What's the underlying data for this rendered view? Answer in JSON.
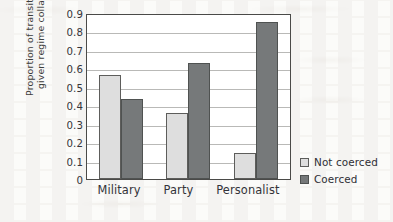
{
  "chart_data": {
    "type": "bar",
    "title": "",
    "xlabel": "",
    "ylabel": "Proportion of transitions, given regime collapse",
    "ylabel_lines": [
      "Proportion of transitions,",
      "given regime collapse"
    ],
    "categories": [
      "Military",
      "Party",
      "Personalist"
    ],
    "series": [
      {
        "name": "Not coerced",
        "color": "#dedede",
        "values": [
          0.565,
          0.36,
          0.14
        ]
      },
      {
        "name": "Coerced",
        "color": "#76797a",
        "values": [
          0.435,
          0.63,
          0.85
        ]
      }
    ],
    "ylim": [
      0,
      0.9
    ],
    "ytick_values": [
      0.9,
      0.8,
      0.7,
      0.6,
      0.5,
      0.4,
      0.3,
      0.2,
      0.1,
      0
    ],
    "ytick_labels": [
      "0.9",
      "0.8",
      "0.7",
      "0.6",
      "0.5",
      "0.4",
      "0.3",
      "0.2",
      "0.1",
      "0"
    ],
    "grid": true,
    "legend_position": "right-bottom"
  },
  "legend": {
    "entries": [
      {
        "label": "Not coerced"
      },
      {
        "label": "Coerced"
      }
    ]
  }
}
